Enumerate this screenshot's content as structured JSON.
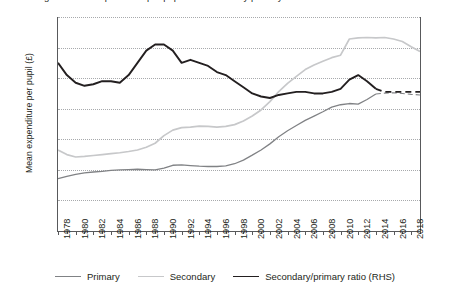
{
  "title_clipped": "Figure: Mean expenditure per pupil and secondary/primary ratio",
  "axes": {
    "left_title": "Mean expenditure per pupil (£)",
    "left_ticks": [
      "0",
      "1,000",
      "2,000",
      "3,000",
      "4,000",
      "5,000",
      "6,000",
      "7,000"
    ],
    "right_ticks": [
      "0.4",
      "0.6",
      "0.8",
      "1.0",
      "1.2",
      "1.4",
      "1.6",
      "1.8"
    ],
    "x_ticks": [
      "1978",
      "1980",
      "1982",
      "1984",
      "1986",
      "1988",
      "1990",
      "1992",
      "1994",
      "1996",
      "1998",
      "2000",
      "2002",
      "2004",
      "2006",
      "2008",
      "2010",
      "2012",
      "2014",
      "2016",
      "2018"
    ]
  },
  "legend": {
    "items": [
      {
        "label": "Primary",
        "color": "#808285",
        "width": 1.3,
        "dash": "none"
      },
      {
        "label": "Secondary",
        "color": "#c7c8ca",
        "width": 1.6,
        "dash": "none"
      },
      {
        "label": "Secondary/primary ratio (RHS)",
        "color": "#231f20",
        "width": 1.9,
        "dash": "none"
      }
    ]
  },
  "colors": {
    "primary": "#808285",
    "secondary": "#c7c8ca",
    "ratio": "#231f20",
    "grid": "#a7a9ac",
    "axis": "#58595b",
    "text": "#231f20"
  },
  "chart_data": {
    "type": "line",
    "title": "Mean expenditure per pupil and secondary/primary ratio",
    "xlabel": "",
    "ylabel": "Mean expenditure per pupil (£)",
    "y2label": "Secondary/primary ratio (RHS)",
    "xlim": [
      1978,
      2019
    ],
    "ylim": [
      0,
      7000
    ],
    "y2lim": [
      0.4,
      1.8
    ],
    "grid": true,
    "legend_position": "bottom",
    "x": [
      1978,
      1979,
      1980,
      1981,
      1982,
      1983,
      1984,
      1985,
      1986,
      1987,
      1988,
      1989,
      1990,
      1991,
      1992,
      1993,
      1994,
      1995,
      1996,
      1997,
      1998,
      1999,
      2000,
      2001,
      2002,
      2003,
      2004,
      2005,
      2006,
      2007,
      2008,
      2009,
      2010,
      2011,
      2012,
      2013,
      2014,
      2015,
      2016,
      2017,
      2018,
      2019
    ],
    "series": [
      {
        "name": "Primary",
        "axis": "left",
        "color": "#808285",
        "solid_until": 2014,
        "values": [
          1710,
          1790,
          1850,
          1900,
          1930,
          1950,
          1980,
          2000,
          2010,
          2020,
          2010,
          2000,
          2060,
          2150,
          2160,
          2140,
          2120,
          2110,
          2110,
          2130,
          2200,
          2320,
          2480,
          2650,
          2850,
          3080,
          3280,
          3450,
          3620,
          3760,
          3900,
          4050,
          4130,
          4170,
          4150,
          4300,
          4480,
          null,
          null,
          null,
          null,
          null
        ]
      },
      {
        "name": "Secondary",
        "axis": "left",
        "color": "#c7c8ca",
        "solid_until": 2019,
        "values": [
          2650,
          2500,
          2420,
          2440,
          2470,
          2500,
          2530,
          2560,
          2600,
          2650,
          2740,
          2870,
          3120,
          3300,
          3380,
          3400,
          3430,
          3420,
          3400,
          3420,
          3480,
          3600,
          3760,
          3960,
          4230,
          4560,
          4830,
          5060,
          5280,
          5430,
          5550,
          5670,
          5750,
          6280,
          6320,
          6330,
          6320,
          6330,
          6280,
          6200,
          6030,
          5870
        ]
      },
      {
        "name": "Secondary/primary ratio (RHS)",
        "axis": "right",
        "color": "#231f20",
        "solid_until": 2014,
        "values": [
          1.5,
          1.42,
          1.37,
          1.35,
          1.36,
          1.38,
          1.38,
          1.37,
          1.42,
          1.5,
          1.58,
          1.62,
          1.62,
          1.58,
          1.5,
          1.52,
          1.5,
          1.48,
          1.44,
          1.42,
          1.38,
          1.34,
          1.3,
          1.28,
          1.27,
          1.29,
          1.3,
          1.31,
          1.31,
          1.3,
          1.3,
          1.31,
          1.33,
          1.39,
          1.42,
          1.38,
          1.33,
          null,
          null,
          null,
          null,
          null
        ]
      },
      {
        "name": "Primary (projected)",
        "axis": "left",
        "color": "#808285",
        "dashed": true,
        "values": [
          null,
          null,
          null,
          null,
          null,
          null,
          null,
          null,
          null,
          null,
          null,
          null,
          null,
          null,
          null,
          null,
          null,
          null,
          null,
          null,
          null,
          null,
          null,
          null,
          null,
          null,
          null,
          null,
          null,
          null,
          null,
          null,
          null,
          null,
          null,
          null,
          4480,
          4510,
          4520,
          4500,
          4470,
          4450
        ]
      },
      {
        "name": "Secondary/primary ratio (projected)",
        "axis": "right",
        "color": "#231f20",
        "dashed": true,
        "values": [
          null,
          null,
          null,
          null,
          null,
          null,
          null,
          null,
          null,
          null,
          null,
          null,
          null,
          null,
          null,
          null,
          null,
          null,
          null,
          null,
          null,
          null,
          null,
          null,
          null,
          null,
          null,
          null,
          null,
          null,
          null,
          null,
          null,
          null,
          null,
          null,
          1.33,
          1.31,
          1.31,
          1.31,
          1.31,
          1.31
        ]
      }
    ]
  }
}
